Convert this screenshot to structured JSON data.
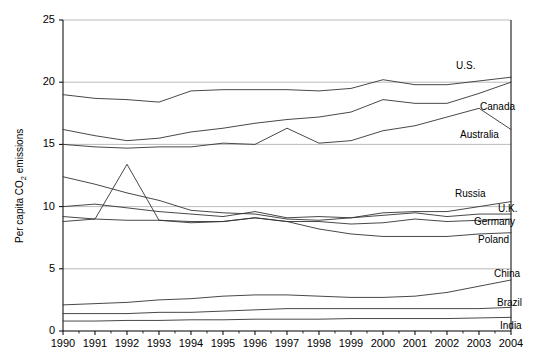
{
  "chart_data": {
    "type": "line",
    "title": "",
    "xlabel": "",
    "ylabel": "Per capita CO2 emissions",
    "ylabel_prefix": "Per capita CO",
    "ylabel_sub": "2",
    "ylabel_suffix": " emissions",
    "x": [
      1990,
      1991,
      1992,
      1993,
      1994,
      1995,
      1996,
      1997,
      1998,
      1999,
      2000,
      2001,
      2002,
      2003,
      2004
    ],
    "xlim": [
      1990,
      2004
    ],
    "ylim": [
      0,
      25
    ],
    "yticks": [
      0,
      5,
      10,
      15,
      20,
      25
    ],
    "xticks": [
      "1990",
      "1991",
      "1992",
      "1993",
      "1994",
      "1995",
      "1996",
      "1997",
      "1998",
      "1999",
      "2000",
      "2001",
      "2002",
      "2003",
      "2004"
    ],
    "grid": "horizontal-major",
    "grid_color": "#aaaaaa",
    "line_color": "#333333",
    "legend_position": "inline-right-of-lines",
    "series": [
      {
        "name": "U.S.",
        "label": "U.S.",
        "label_x": 456,
        "label_y": 60,
        "values": [
          19.0,
          18.7,
          18.6,
          18.4,
          19.3,
          19.4,
          19.4,
          19.4,
          19.3,
          19.5,
          20.2,
          19.8,
          19.8,
          20.1,
          20.4
        ]
      },
      {
        "name": "Canada",
        "label": "Canada",
        "label_x": 480,
        "label_y": 101,
        "values": [
          16.2,
          15.7,
          15.3,
          15.5,
          16.0,
          16.3,
          16.7,
          17.0,
          17.2,
          17.6,
          18.6,
          18.3,
          18.3,
          19.1,
          20.0
        ]
      },
      {
        "name": "Australia",
        "label": "Australia",
        "label_x": 460,
        "label_y": 129,
        "values": [
          15.0,
          14.8,
          14.7,
          14.8,
          14.8,
          15.1,
          15.0,
          16.3,
          15.1,
          15.3,
          16.1,
          16.5,
          17.2,
          17.9,
          16.2
        ]
      },
      {
        "name": "Russia",
        "label": "Russia",
        "label_x": 455,
        "label_y": 188,
        "values": [
          12.4,
          11.8,
          11.1,
          10.5,
          9.7,
          9.5,
          9.4,
          9.0,
          8.9,
          9.1,
          9.5,
          9.6,
          9.6,
          10.0,
          10.4
        ]
      },
      {
        "name": "U.K.",
        "label": "U.K.",
        "label_x": 498,
        "label_y": 203,
        "values": [
          10.0,
          10.2,
          9.9,
          9.6,
          9.4,
          9.2,
          9.6,
          9.1,
          9.2,
          9.1,
          9.3,
          9.5,
          9.2,
          9.4,
          9.4
        ]
      },
      {
        "name": "Germany",
        "label": "Germany",
        "label_x": 474,
        "label_y": 216,
        "values": [
          9.2,
          9.0,
          8.9,
          8.9,
          8.8,
          8.8,
          9.1,
          8.8,
          8.8,
          8.6,
          8.7,
          9.0,
          8.8,
          8.9,
          9.0
        ]
      },
      {
        "name": "Poland",
        "label": "Poland",
        "label_x": 478,
        "label_y": 234,
        "values": [
          8.8,
          9.0,
          13.4,
          8.9,
          8.7,
          8.8,
          9.1,
          8.8,
          8.2,
          7.8,
          7.6,
          7.6,
          7.6,
          7.8,
          7.9
        ]
      },
      {
        "name": "China",
        "label": "China",
        "label_x": 494,
        "label_y": 268,
        "values": [
          2.1,
          2.2,
          2.3,
          2.5,
          2.6,
          2.8,
          2.9,
          2.9,
          2.8,
          2.7,
          2.7,
          2.8,
          3.1,
          3.6,
          4.1
        ]
      },
      {
        "name": "Brazil",
        "label": "Brazil",
        "label_x": 497,
        "label_y": 297,
        "values": [
          1.4,
          1.4,
          1.4,
          1.5,
          1.5,
          1.6,
          1.7,
          1.8,
          1.8,
          1.8,
          1.8,
          1.8,
          1.8,
          1.8,
          1.9
        ]
      },
      {
        "name": "India",
        "label": "India",
        "label_x": 500,
        "label_y": 320,
        "values": [
          0.8,
          0.8,
          0.85,
          0.85,
          0.9,
          0.9,
          0.95,
          0.95,
          0.95,
          1.0,
          1.0,
          1.0,
          1.0,
          1.05,
          1.1
        ]
      }
    ]
  }
}
